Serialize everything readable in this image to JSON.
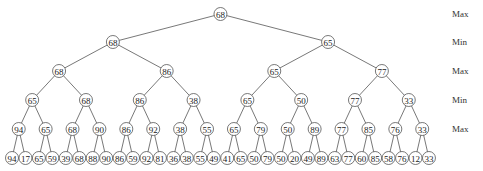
{
  "diagram": {
    "type": "minimax-tree",
    "level_labels": [
      "Max",
      "Min",
      "Max",
      "Min",
      "Max"
    ],
    "levels": [
      [
        68
      ],
      [
        68,
        65
      ],
      [
        68,
        86,
        65,
        77
      ],
      [
        65,
        68,
        86,
        38,
        65,
        50,
        77,
        33
      ],
      [
        94,
        65,
        68,
        90,
        86,
        92,
        38,
        55,
        65,
        79,
        50,
        89,
        77,
        85,
        76,
        33
      ],
      [
        94,
        17,
        65,
        59,
        39,
        68,
        88,
        90,
        86,
        59,
        92,
        81,
        36,
        38,
        55,
        49,
        41,
        65,
        50,
        79,
        50,
        20,
        49,
        89,
        63,
        77,
        60,
        85,
        58,
        76,
        12,
        33
      ]
    ]
  }
}
